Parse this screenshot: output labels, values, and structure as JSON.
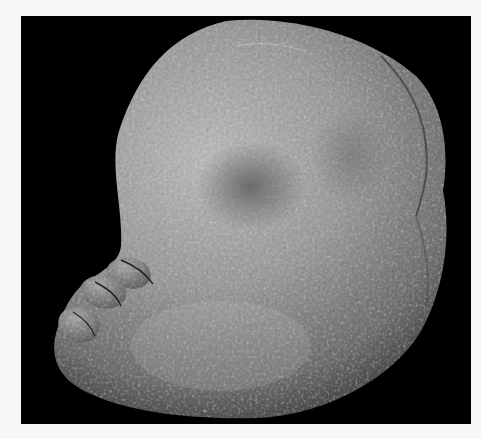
{
  "image": {
    "subject": "specimen-photograph",
    "background_color": "#f7f7f7",
    "panel_color": "#000000",
    "description": "Grayscale photograph of a rounded, textured specimen with toe-like lobes on the lower left, on a black background"
  }
}
